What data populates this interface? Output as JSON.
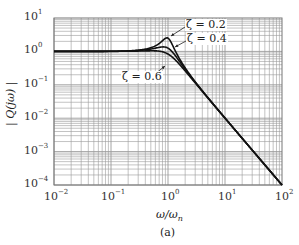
{
  "chart_data": {
    "type": "line",
    "title": "",
    "caption": "(a)",
    "xlabel": "ω/ωn",
    "ylabel": "|Q(jω)|",
    "xscale": "log",
    "yscale": "log",
    "xlim": [
      0.01,
      100
    ],
    "ylim": [
      0.0001,
      10
    ],
    "grid": true,
    "x_tick_labels": [
      "10^-2",
      "10^-1",
      "10^0",
      "10^1",
      "10^2"
    ],
    "y_tick_labels": [
      "10^1",
      "10^0",
      "10^-1",
      "10^-2",
      "10^-3",
      "10^-4"
    ],
    "series": [
      {
        "name": "ζ = 0.2",
        "zeta": 0.2,
        "peak_approx": 2.55
      },
      {
        "name": "ζ = 0.4",
        "zeta": 0.4,
        "peak_approx": 1.36
      },
      {
        "name": "ζ = 0.6",
        "zeta": 0.6,
        "peak_approx": 1.04
      }
    ],
    "annotations": [
      "ζ = 0.2",
      "ζ = 0.4",
      "ζ = 0.6"
    ],
    "sample_points": {
      "x": [
        0.01,
        0.1,
        0.5,
        1.0,
        2.0,
        10,
        100
      ],
      "zeta_0.2": [
        1.0,
        1.01,
        1.29,
        2.5,
        0.32,
        0.0101,
        0.0001
      ],
      "zeta_0.4": [
        1.0,
        1.01,
        1.24,
        1.25,
        0.3,
        0.0101,
        0.0001
      ],
      "zeta_0.6": [
        1.0,
        1.0,
        1.14,
        0.83,
        0.28,
        0.0101,
        0.0001
      ]
    }
  },
  "labels": {
    "x_ticks": [
      {
        "base": "10",
        "exp": "−2"
      },
      {
        "base": "10",
        "exp": "−1"
      },
      {
        "base": "10",
        "exp": "0"
      },
      {
        "base": "10",
        "exp": "1"
      },
      {
        "base": "10",
        "exp": "2"
      }
    ],
    "y_ticks": [
      {
        "base": "10",
        "exp": "1"
      },
      {
        "base": "10",
        "exp": "0"
      },
      {
        "base": "10",
        "exp": "−1"
      },
      {
        "base": "10",
        "exp": "−2"
      },
      {
        "base": "10",
        "exp": "−3"
      },
      {
        "base": "10",
        "exp": "−4"
      }
    ],
    "ylabel": "| Q(jω) |",
    "xlabel": "ω/ωn",
    "xlabel_main": "ω/ω",
    "xlabel_sub": "n",
    "caption": "(a)",
    "ann_02": "ζ = 0.2",
    "ann_04": "ζ = 0.4",
    "ann_06": "ζ = 0.6"
  },
  "colors": {
    "grid": "#9a9a9a",
    "curve": "#111111",
    "frame": "#777777"
  }
}
